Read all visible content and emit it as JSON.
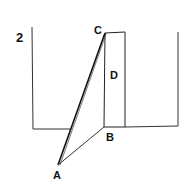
{
  "figure": {
    "number_label": "2",
    "points": {
      "A": {
        "label": "A",
        "x": 58,
        "y": 165
      },
      "B": {
        "label": "B",
        "x": 104,
        "y": 127
      },
      "C": {
        "label": "C",
        "x": 105,
        "y": 33
      },
      "D": {
        "label": "D"
      }
    },
    "colors": {
      "stroke": "#222222",
      "background": "#ffffff"
    }
  }
}
